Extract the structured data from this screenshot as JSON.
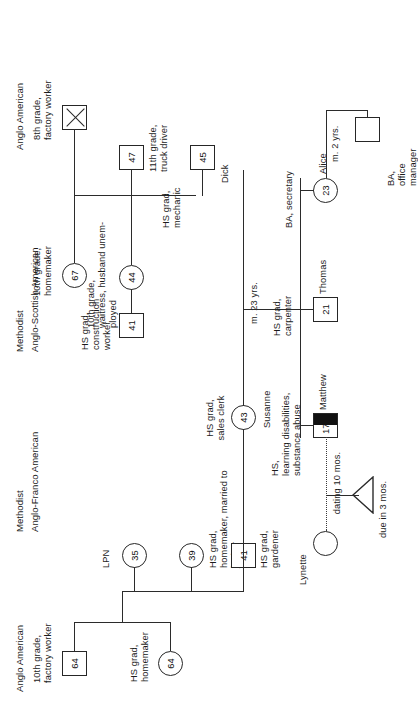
{
  "diagram": {
    "type": "genogram",
    "ethnicity_headers": [
      {
        "key": "anglo_american_top",
        "text": "Anglo American"
      },
      {
        "key": "methodist_top",
        "text": "Methodist"
      },
      {
        "key": "anglo_franco",
        "text": "Anglo-Franco American"
      },
      {
        "key": "methodist_bottom",
        "text": "Methodist"
      },
      {
        "key": "anglo_scottish",
        "text": "Anglo-Scottish American"
      },
      {
        "key": "anglo_american_bottom",
        "text": "Anglo American"
      }
    ],
    "persons": [
      {
        "id": "p_gf_paternal",
        "shape": "square",
        "age": "64",
        "desc": "10th grade,\nfactory worker",
        "name": ""
      },
      {
        "id": "p_gm_paternal",
        "shape": "circle",
        "age": "64",
        "desc": "HS grad,\nhomemaker",
        "name": ""
      },
      {
        "id": "p_aunt_35",
        "shape": "circle",
        "age": "35",
        "desc": "LPN",
        "name": ""
      },
      {
        "id": "p_aunt_39",
        "shape": "circle",
        "age": "39",
        "desc": "HS grad,\nhomemaker, married to\njanitor",
        "name": ""
      },
      {
        "id": "p_uncle_41",
        "shape": "square",
        "age": "41",
        "desc": "HS grad,\ngardener",
        "name": ""
      },
      {
        "id": "p_susanne",
        "shape": "circle",
        "age": "43",
        "desc": "HS grad,\nsales clerk",
        "name": "Susanne"
      },
      {
        "id": "p_gf_maternal",
        "shape": "square-deceased",
        "age": "",
        "desc": "8th grade,\nfactory worker",
        "name": ""
      },
      {
        "id": "p_gm_maternal",
        "shape": "circle",
        "age": "67",
        "desc": "10th grade,\nhomemaker",
        "name": ""
      },
      {
        "id": "p_uncle_47",
        "shape": "square",
        "age": "47",
        "desc": "11th grade,\ntruck driver",
        "name": ""
      },
      {
        "id": "p_aunt_44",
        "shape": "circle",
        "age": "44",
        "desc": "10th grade,\nwaitress, husband unem-\nployed",
        "name": ""
      },
      {
        "id": "p_uncle_41b",
        "shape": "square",
        "age": "41",
        "desc": "HS grad,\nconstruction\nworker",
        "name": ""
      },
      {
        "id": "p_dick",
        "shape": "square",
        "age": "45",
        "desc": "HS grad,\nmechanic",
        "name": "Dick"
      },
      {
        "id": "p_matthew",
        "shape": "square-shaded",
        "age": "17",
        "desc": "HS,\nlearning disabilities,\nsubstance abuse",
        "name": "Matthew"
      },
      {
        "id": "p_thomas",
        "shape": "square",
        "age": "21",
        "desc": "HS grad,\ncarpenter",
        "name": "Thomas"
      },
      {
        "id": "p_alice",
        "shape": "circle",
        "age": "23",
        "desc": "BA, secretary",
        "name": "Alice"
      },
      {
        "id": "p_alice_husband",
        "shape": "square",
        "age": "",
        "desc": "BA,\noffice\nmanager",
        "name": ""
      },
      {
        "id": "p_lynette",
        "shape": "circle",
        "age": "",
        "desc": "",
        "name": "Lynette"
      },
      {
        "id": "p_unborn",
        "shape": "triangle",
        "age": "",
        "desc": "",
        "name": ""
      }
    ],
    "relationship_labels": [
      {
        "id": "m23",
        "text": "m. 23 yrs."
      },
      {
        "id": "m2",
        "text": "m. 2 yrs."
      },
      {
        "id": "dating10",
        "text": "dating 10 mos."
      },
      {
        "id": "due3",
        "text": "due in 3 mos."
      }
    ],
    "legend_notes": {
      "shaded_square": "substance abuse / identified problem",
      "x_square": "deceased",
      "dotted_line": "dating relationship",
      "triangle": "pregnancy"
    },
    "colors": {
      "line": "#2b2b2b",
      "text": "#1b1b1b",
      "shade_fill": "#111111",
      "background": "#ffffff"
    }
  }
}
